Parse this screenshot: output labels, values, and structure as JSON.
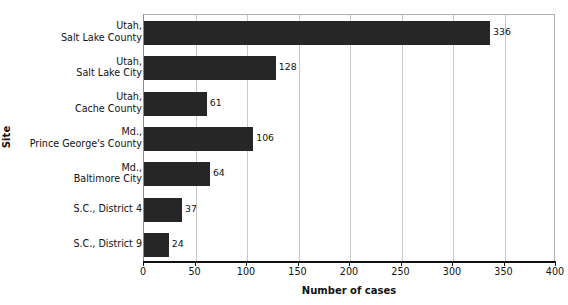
{
  "chart_data": {
    "type": "bar",
    "orientation": "horizontal",
    "title": "",
    "xlabel": "Number of cases",
    "ylabel": "Site",
    "categories": [
      "Utah,\nSalt Lake County",
      "Utah,\nSalt Lake City",
      "Utah,\nCache County",
      "Md.,\nPrince George's County",
      "Md.,\nBaltimore City",
      "S.C., District 4",
      "S.C., District 9"
    ],
    "values": [
      336,
      128,
      61,
      106,
      64,
      37,
      24
    ],
    "value_labels": [
      "336",
      "128",
      "61",
      "106",
      "64",
      "37",
      "24"
    ],
    "xlim": [
      0,
      400
    ],
    "xticks": [
      0,
      50,
      100,
      150,
      200,
      250,
      300,
      350,
      400
    ],
    "xtick_labels": [
      "0",
      "50",
      "100",
      "150",
      "200",
      "250",
      "300",
      "350",
      "400"
    ],
    "grid": "vertical",
    "legend": "none",
    "bar_color": "#262626",
    "gridline_color": "#c9c9c9",
    "axis_color": "#111111",
    "background_color": "#ffffff"
  },
  "axes": {
    "y_title": "Site",
    "x_title": "Number of cases"
  },
  "category_labels": [
    {
      "line1": "Utah,",
      "line2": "Salt Lake County"
    },
    {
      "line1": "Utah,",
      "line2": "Salt Lake City"
    },
    {
      "line1": "Utah,",
      "line2": "Cache County"
    },
    {
      "line1": "Md.,",
      "line2": "Prince George's County"
    },
    {
      "line1": "Md.,",
      "line2": "Baltimore City"
    },
    {
      "line1": "S.C., District 4",
      "line2": ""
    },
    {
      "line1": "S.C., District 9",
      "line2": ""
    }
  ]
}
